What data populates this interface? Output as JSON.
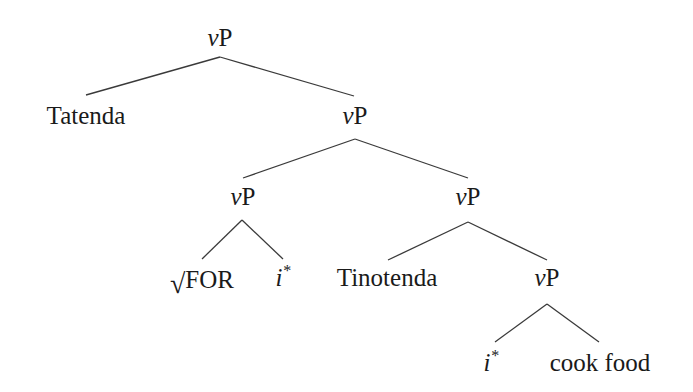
{
  "diagram": {
    "type": "syntax-tree",
    "nodes": {
      "root": {
        "cat_v": "v",
        "cat_p": "P"
      },
      "tatenda": {
        "label": "Tatenda"
      },
      "vp2": {
        "cat_v": "v",
        "cat_p": "P"
      },
      "vp_left": {
        "cat_v": "v",
        "cat_p": "P"
      },
      "root_for": {
        "sign": "√",
        "label": "FOR"
      },
      "i_star_1": {
        "label": "i",
        "sup": "*"
      },
      "vp_right": {
        "cat_v": "v",
        "cat_p": "P"
      },
      "tinotenda": {
        "label": "Tinotenda"
      },
      "vp_bottom": {
        "cat_v": "v",
        "cat_p": "P"
      },
      "i_star_2": {
        "label": "i",
        "sup": "*"
      },
      "cook_food": {
        "label": "cook food"
      }
    },
    "edges": [
      {
        "from": "root",
        "to": "tatenda"
      },
      {
        "from": "root",
        "to": "vp2"
      },
      {
        "from": "vp2",
        "to": "vp_left"
      },
      {
        "from": "vp2",
        "to": "vp_right"
      },
      {
        "from": "vp_left",
        "to": "root_for"
      },
      {
        "from": "vp_left",
        "to": "i_star_1"
      },
      {
        "from": "vp_right",
        "to": "tinotenda"
      },
      {
        "from": "vp_right",
        "to": "vp_bottom"
      },
      {
        "from": "vp_bottom",
        "to": "i_star_2"
      },
      {
        "from": "vp_bottom",
        "to": "cook_food"
      }
    ]
  }
}
